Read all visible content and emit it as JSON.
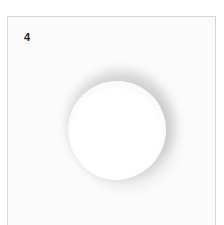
{
  "panel": {
    "label": "4",
    "border_color": "#d6d6d6",
    "background_color": "#fbfbfb"
  },
  "shape": {
    "type": "circle",
    "fill": "#ffffff",
    "shadow": "soft drop shadow"
  }
}
